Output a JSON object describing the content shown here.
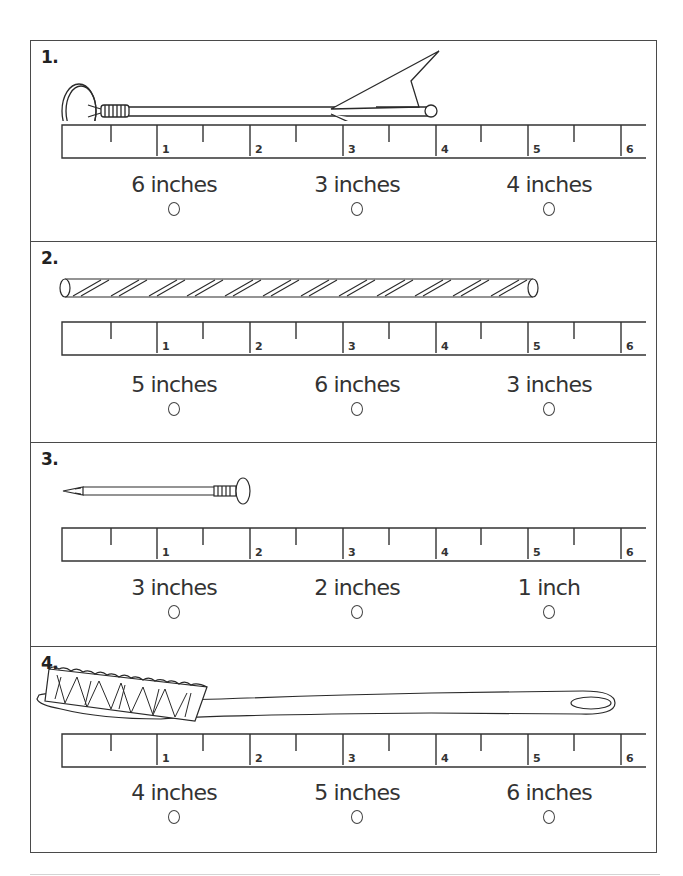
{
  "worksheet": {
    "ruler": {
      "unit": "inches",
      "labels": [
        "1",
        "2",
        "3",
        "4",
        "5",
        "6"
      ]
    },
    "questions": [
      {
        "number": "1.",
        "object": "arrow",
        "choices": [
          {
            "label": "6 inches",
            "selected": false
          },
          {
            "label": "3 inches",
            "selected": false
          },
          {
            "label": "4 inches",
            "selected": false
          }
        ]
      },
      {
        "number": "2.",
        "object": "straw",
        "choices": [
          {
            "label": "5 inches",
            "selected": false
          },
          {
            "label": "6 inches",
            "selected": false
          },
          {
            "label": "3 inches",
            "selected": false
          }
        ]
      },
      {
        "number": "3.",
        "object": "nail",
        "choices": [
          {
            "label": "3 inches",
            "selected": false
          },
          {
            "label": "2 inches",
            "selected": false
          },
          {
            "label": "1 inch",
            "selected": false
          }
        ]
      },
      {
        "number": "4.",
        "object": "toothbrush",
        "choices": [
          {
            "label": "4 inches",
            "selected": false
          },
          {
            "label": "5 inches",
            "selected": false
          },
          {
            "label": "6 inches",
            "selected": false
          }
        ]
      }
    ]
  },
  "colors": {
    "ink": "#2a2a2a",
    "border": "#4a4a4a",
    "background": "#ffffff"
  }
}
